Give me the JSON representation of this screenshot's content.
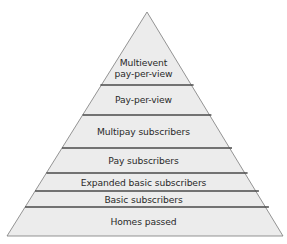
{
  "diagram": {
    "type": "pyramid",
    "fill": "#ececec",
    "stroke": "#555555",
    "levels": [
      {
        "label_line1": "Multievent",
        "label_line2": "pay-per-view"
      },
      {
        "label": "Pay-per-view"
      },
      {
        "label": "Multipay subscribers"
      },
      {
        "label": "Pay subscribers"
      },
      {
        "label": "Expanded basic subscribers"
      },
      {
        "label": "Basic subscribers"
      },
      {
        "label": "Homes passed"
      }
    ]
  }
}
